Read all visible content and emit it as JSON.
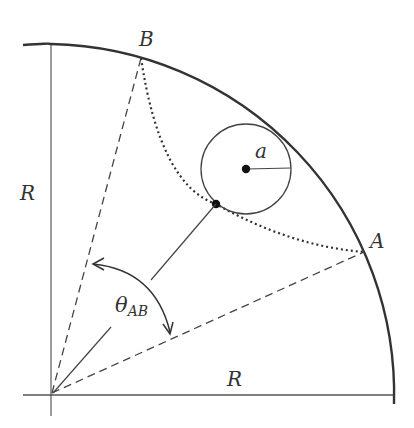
{
  "figure": {
    "labels": {
      "point_B": "B",
      "point_A": "A",
      "radius_vertical": "R",
      "radius_horizontal": "R",
      "small_radius": "a",
      "angle_symbol": "θ",
      "angle_subscript": "AB"
    },
    "colors": {
      "stroke": "#333333",
      "axis": "#555555",
      "background": "#ffffff"
    }
  }
}
